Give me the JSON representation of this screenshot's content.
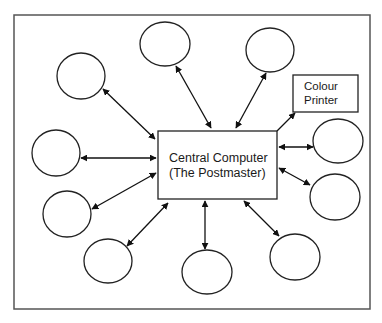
{
  "diagram": {
    "type": "hub-and-spoke network",
    "frame": {
      "x": 14,
      "y": 15,
      "width": 356,
      "height": 294
    },
    "colors": {
      "stroke": "#222222",
      "frame": "#555555",
      "background": "#ffffff"
    },
    "central_node": {
      "id": "central",
      "line1": "Central Computer",
      "line2": "(The Postmaster)",
      "x": 158,
      "y": 131,
      "width": 119,
      "height": 68
    },
    "printer_node": {
      "id": "printer",
      "line1": "Colour",
      "line2": "Printer",
      "x": 293,
      "y": 75,
      "width": 65,
      "height": 37
    },
    "terminals": [
      {
        "id": "terminal-1",
        "cx": 81,
        "cy": 76,
        "rx": 24,
        "ry": 23
      },
      {
        "id": "terminal-2",
        "cx": 165,
        "cy": 44,
        "rx": 25,
        "ry": 22
      },
      {
        "id": "terminal-3",
        "cx": 270,
        "cy": 50,
        "rx": 24,
        "ry": 22
      },
      {
        "id": "terminal-4",
        "cx": 338,
        "cy": 141,
        "rx": 25,
        "ry": 22
      },
      {
        "id": "terminal-5",
        "cx": 335,
        "cy": 197,
        "rx": 25,
        "ry": 23
      },
      {
        "id": "terminal-6",
        "cx": 56,
        "cy": 153,
        "rx": 24,
        "ry": 23
      },
      {
        "id": "terminal-7",
        "cx": 67,
        "cy": 214,
        "rx": 24,
        "ry": 23
      },
      {
        "id": "terminal-8",
        "cx": 108,
        "cy": 261,
        "rx": 24,
        "ry": 22
      },
      {
        "id": "terminal-9",
        "cx": 207,
        "cy": 272,
        "rx": 25,
        "ry": 22
      },
      {
        "id": "terminal-10",
        "cx": 295,
        "cy": 257,
        "rx": 25,
        "ry": 23
      }
    ],
    "connections": [
      {
        "from": "terminal-1",
        "to": "central",
        "x1": 103,
        "y1": 89,
        "x2": 155,
        "y2": 139,
        "bidirectional": true
      },
      {
        "from": "terminal-2",
        "to": "central",
        "x1": 176,
        "y1": 66,
        "x2": 211,
        "y2": 128,
        "bidirectional": true
      },
      {
        "from": "terminal-3",
        "to": "central",
        "x1": 266,
        "y1": 73,
        "x2": 236,
        "y2": 128,
        "bidirectional": true
      },
      {
        "from": "central",
        "to": "printer",
        "x1": 277,
        "y1": 131,
        "x2": 295,
        "y2": 113,
        "bidirectional": false
      },
      {
        "from": "terminal-4",
        "to": "central",
        "x1": 313,
        "y1": 147,
        "x2": 279,
        "y2": 147,
        "bidirectional": true
      },
      {
        "from": "terminal-5",
        "to": "central",
        "x1": 310,
        "y1": 185,
        "x2": 279,
        "y2": 168,
        "bidirectional": true
      },
      {
        "from": "terminal-6",
        "to": "central",
        "x1": 81,
        "y1": 158,
        "x2": 156,
        "y2": 158,
        "bidirectional": true
      },
      {
        "from": "terminal-7",
        "to": "central",
        "x1": 92,
        "y1": 209,
        "x2": 156,
        "y2": 173,
        "bidirectional": true
      },
      {
        "from": "terminal-8",
        "to": "central",
        "x1": 127,
        "y1": 246,
        "x2": 168,
        "y2": 203,
        "bidirectional": true
      },
      {
        "from": "terminal-9",
        "to": "central",
        "x1": 205,
        "y1": 249,
        "x2": 205,
        "y2": 201,
        "bidirectional": true
      },
      {
        "from": "terminal-10",
        "to": "central",
        "x1": 279,
        "y1": 236,
        "x2": 244,
        "y2": 201,
        "bidirectional": true
      }
    ]
  }
}
